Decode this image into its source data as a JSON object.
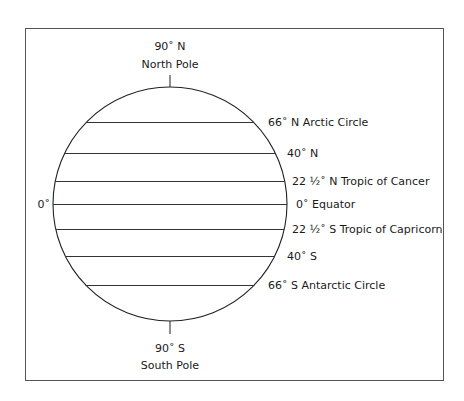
{
  "diagram": {
    "north_pole": {
      "degree": "90˚ N",
      "name": "North Pole"
    },
    "south_pole": {
      "degree": "90˚ S",
      "name": "South Pole"
    },
    "left_label": "0˚",
    "latitudes": [
      {
        "label": "66˚ N Arctic Circle",
        "y": 122
      },
      {
        "label": "40˚ N",
        "y": 153
      },
      {
        "label": "22 ½˚ N Tropic of Cancer",
        "y": 181
      },
      {
        "label": "0˚ Equator",
        "y": 204
      },
      {
        "label": "22 ½˚ S Tropic of Capricorn",
        "y": 229
      },
      {
        "label": "40˚ S",
        "y": 256
      },
      {
        "label": "66˚ S Antarctic Circle",
        "y": 285
      }
    ],
    "colors": {
      "line": "#333333",
      "frame": "#555555"
    }
  }
}
